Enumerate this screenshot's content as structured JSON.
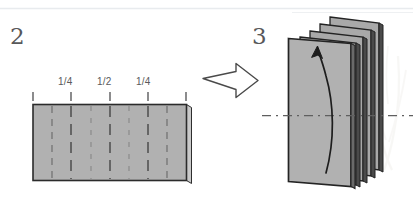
{
  "diagram": {
    "background_color": "#ffffff",
    "paper_fill": "#b0b0b0",
    "paper_stroke": "#2b2b2b",
    "fold_line_color": "#6d6d6d",
    "text_color": "#58585a",
    "top_rule_color": "#e9ecef"
  },
  "steps": [
    {
      "number": "2",
      "name": "flat-sheet-with-fold-marks",
      "tick_labels": [
        "1/4",
        "1/2",
        "1/4"
      ],
      "tick_count": 5,
      "fold_line_count": 5
    },
    {
      "number": "3",
      "name": "accordion-folded-stack",
      "layer_count": 4,
      "center_line": "dash-dot",
      "motion_arrow": "curved-up-arrow"
    }
  ],
  "transition": {
    "arrow": "block-arrow-right",
    "label": ""
  }
}
